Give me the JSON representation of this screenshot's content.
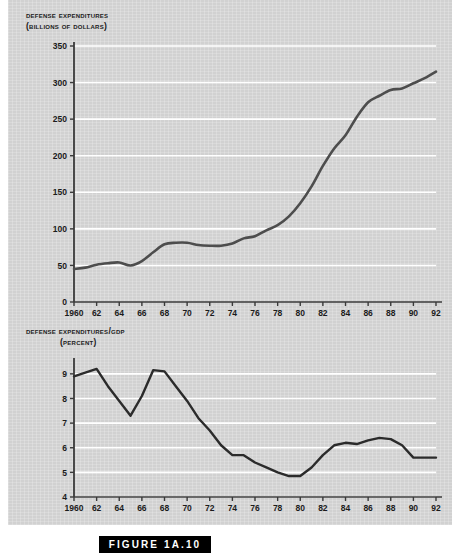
{
  "figure": {
    "caption": "FIGURE 1A.10"
  },
  "charts": {
    "top": {
      "title_line1": "Defense expenditures",
      "title_line2": "(billions of dollars)"
    },
    "bottom": {
      "title_line1": "Defense expenditures/GDP",
      "title_line2": "(percent)"
    }
  },
  "chart_data": [
    {
      "id": "defense-expenditures",
      "type": "line",
      "title": "Defense expenditures (billions of dollars)",
      "xlabel": "",
      "ylabel": "Billions of dollars",
      "xlim": [
        1960,
        1992
      ],
      "ylim": [
        0,
        350
      ],
      "yticks": [
        0,
        50,
        100,
        150,
        200,
        250,
        300,
        350
      ],
      "ytick_labels": [
        "0",
        "50",
        "100",
        "150",
        "200",
        "250",
        "300",
        "350"
      ],
      "xticks": [
        1960,
        1962,
        1964,
        1966,
        1968,
        1970,
        1972,
        1974,
        1976,
        1978,
        1980,
        1982,
        1984,
        1986,
        1988,
        1990,
        1992
      ],
      "xtick_labels": [
        "1960",
        "62",
        "64",
        "66",
        "68",
        "70",
        "72",
        "74",
        "76",
        "78",
        "80",
        "82",
        "84",
        "86",
        "88",
        "90",
        "92"
      ],
      "grid": "horizontal",
      "legend": "none",
      "line_color": "#4d4d4d",
      "x": [
        1960,
        1961,
        1962,
        1963,
        1964,
        1965,
        1966,
        1967,
        1968,
        1969,
        1970,
        1971,
        1972,
        1973,
        1974,
        1975,
        1976,
        1977,
        1978,
        1979,
        1980,
        1981,
        1982,
        1983,
        1984,
        1985,
        1986,
        1987,
        1988,
        1989,
        1990,
        1991,
        1992
      ],
      "values": [
        45,
        47,
        51,
        53,
        54,
        50,
        56,
        68,
        79,
        81,
        81,
        78,
        77,
        77,
        80,
        87,
        90,
        98,
        105,
        117,
        135,
        158,
        186,
        210,
        228,
        253,
        273,
        282,
        290,
        292,
        299,
        306,
        315
      ]
    },
    {
      "id": "defense-expenditures-gdp",
      "type": "line",
      "title": "Defense expenditures/GDP (percent)",
      "xlabel": "",
      "ylabel": "Percent",
      "xlim": [
        1960,
        1992
      ],
      "ylim": [
        4,
        9.4
      ],
      "yticks": [
        4,
        5,
        6,
        7,
        8,
        9
      ],
      "ytick_labels": [
        "4",
        "5",
        "6",
        "7",
        "8",
        "9"
      ],
      "xticks": [
        1960,
        1962,
        1964,
        1966,
        1968,
        1970,
        1972,
        1974,
        1976,
        1978,
        1980,
        1982,
        1984,
        1986,
        1988,
        1990,
        1992
      ],
      "xtick_labels": [
        "1960",
        "62",
        "64",
        "66",
        "68",
        "70",
        "72",
        "74",
        "76",
        "78",
        "80",
        "82",
        "84",
        "86",
        "88",
        "90",
        "92"
      ],
      "grid": "horizontal",
      "legend": "none",
      "line_color": "#2b2b2b",
      "x": [
        1960,
        1961,
        1962,
        1963,
        1964,
        1965,
        1966,
        1967,
        1968,
        1969,
        1970,
        1971,
        1972,
        1973,
        1974,
        1975,
        1976,
        1977,
        1978,
        1979,
        1980,
        1981,
        1982,
        1983,
        1984,
        1985,
        1986,
        1987,
        1988,
        1989,
        1990,
        1991,
        1992
      ],
      "values": [
        8.9,
        9.05,
        9.2,
        8.5,
        7.9,
        7.3,
        8.1,
        9.15,
        9.1,
        8.5,
        7.9,
        7.2,
        6.7,
        6.1,
        5.7,
        5.7,
        5.4,
        5.2,
        5.0,
        4.85,
        4.85,
        5.2,
        5.7,
        6.1,
        6.2,
        6.15,
        6.3,
        6.4,
        6.35,
        6.1,
        5.6,
        5.6,
        5.6
      ]
    }
  ]
}
